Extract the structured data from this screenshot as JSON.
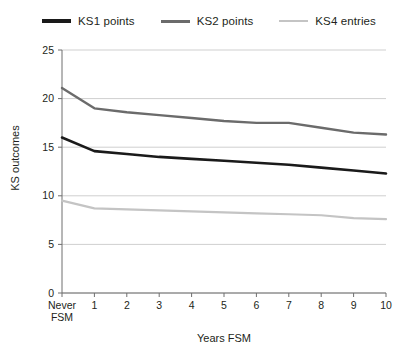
{
  "legend": {
    "position": "top-center",
    "entries": [
      {
        "label": "KS1 points",
        "color": "#1a1a1a",
        "swatch_name": "legend-swatch-ks1"
      },
      {
        "label": "KS2 points",
        "color": "#6b6b6b",
        "swatch_name": "legend-swatch-ks2"
      },
      {
        "label": "KS4 entries",
        "color": "#c4c4c4",
        "swatch_name": "legend-swatch-ks4"
      }
    ]
  },
  "axes": {
    "y_title": "KS outcomes",
    "x_title": "Years FSM",
    "y_ticks": [
      "0",
      "5",
      "10",
      "15",
      "20",
      "25"
    ],
    "x_ticks": [
      "Never FSM",
      "1",
      "2",
      "3",
      "4",
      "5",
      "6",
      "7",
      "8",
      "9",
      "10"
    ],
    "x_first_tick_line1": "Never",
    "x_first_tick_line2": "FSM"
  },
  "chart_data": {
    "type": "line",
    "title": "",
    "subtitle": "",
    "xlabel": "Years FSM",
    "ylabel": "KS outcomes",
    "categories": [
      "Never FSM",
      "1",
      "2",
      "3",
      "4",
      "5",
      "6",
      "7",
      "8",
      "9",
      "10"
    ],
    "ylim": [
      0,
      25
    ],
    "yticks": [
      0,
      5,
      10,
      15,
      20,
      25
    ],
    "grid": true,
    "grid_axis": "y",
    "legend_position": "top-center",
    "series": [
      {
        "name": "KS1 points",
        "color": "#1a1a1a",
        "values": [
          16.0,
          14.6,
          14.3,
          14.0,
          13.8,
          13.6,
          13.4,
          13.2,
          12.9,
          12.6,
          12.3
        ]
      },
      {
        "name": "KS2 points",
        "color": "#6b6b6b",
        "values": [
          21.1,
          19.0,
          18.6,
          18.3,
          18.0,
          17.7,
          17.5,
          17.5,
          17.0,
          16.5,
          16.3
        ]
      },
      {
        "name": "KS4 entries",
        "color": "#c4c4c4",
        "values": [
          9.5,
          8.7,
          8.6,
          8.5,
          8.4,
          8.3,
          8.2,
          8.1,
          8.0,
          7.7,
          7.6
        ]
      }
    ]
  },
  "colors": {
    "axis": "#6e6e6e",
    "grid": "#cfcfcf",
    "text": "#231f20",
    "background": "#ffffff"
  }
}
